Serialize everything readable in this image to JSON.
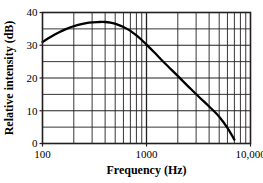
{
  "chart_data": {
    "type": "line",
    "title": "",
    "xlabel": "Frequency (Hz)",
    "ylabel": "Relative intensity (dB)",
    "xscale": "log",
    "yscale": "linear",
    "xlim": [
      100,
      10000
    ],
    "ylim": [
      0,
      40
    ],
    "grid": true,
    "legend": null,
    "x_tick_labels": [
      "100",
      "1000",
      "10,000"
    ],
    "x_tick_values": [
      100,
      1000,
      10000
    ],
    "y_tick_labels": [
      "0",
      "10",
      "20",
      "30",
      "40"
    ],
    "y_tick_values": [
      0,
      10,
      20,
      30,
      40
    ],
    "y_minor_step": 5,
    "x_minor_values": [
      200,
      300,
      400,
      500,
      600,
      700,
      800,
      900,
      2000,
      3000,
      4000,
      5000,
      6000,
      7000,
      8000,
      9000
    ],
    "series": [
      {
        "name": "Relative intensity",
        "x": [
          100,
          130,
          170,
          220,
          280,
          350,
          400,
          450,
          520,
          600,
          700,
          800,
          900,
          1000,
          1200,
          1500,
          2000,
          2600,
          3200,
          4000,
          5000,
          6000,
          7000
        ],
        "y": [
          31.0,
          33.2,
          35.0,
          36.2,
          36.9,
          37.1,
          37.1,
          36.9,
          36.4,
          35.6,
          34.4,
          33.0,
          31.6,
          30.2,
          27.7,
          24.5,
          20.6,
          17.0,
          14.2,
          11.3,
          8.2,
          4.8,
          1.2
        ]
      }
    ]
  },
  "axis": {
    "x_label": "Frequency (Hz)",
    "y_label": "Relative intensity (dB)",
    "x_ticks": [
      "100",
      "1000",
      "10,000"
    ],
    "y_ticks": [
      "0",
      "10",
      "20",
      "30",
      "40"
    ]
  }
}
